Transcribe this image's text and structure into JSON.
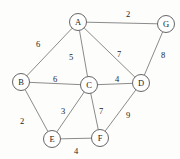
{
  "figure": {
    "type": "undirected-weighted-graph",
    "background_color": "#fdfdfc",
    "node_fill_color": "#ffffff",
    "node_stroke_color": "#555555",
    "edge_color": "#6d6d6d",
    "label_color": "#1c1c1c"
  },
  "chart_data": {
    "type": "diagram",
    "title": "",
    "xlabel": "",
    "ylabel": "",
    "graph_kind": "undirected weighted graph",
    "nodes": [
      {
        "id": "A",
        "label": "A",
        "x": 78,
        "y": 22,
        "r": 8.5
      },
      {
        "id": "G",
        "label": "G",
        "x": 166,
        "y": 24,
        "r": 8.5
      },
      {
        "id": "B",
        "label": "B",
        "x": 21,
        "y": 82,
        "r": 8.5
      },
      {
        "id": "C",
        "label": "C",
        "x": 89,
        "y": 85,
        "r": 8.5
      },
      {
        "id": "D",
        "label": "D",
        "x": 141,
        "y": 83,
        "r": 8.5
      },
      {
        "id": "E",
        "label": "E",
        "x": 52,
        "y": 139,
        "r": 8.5
      },
      {
        "id": "F",
        "label": "F",
        "x": 100,
        "y": 138,
        "r": 8.5
      }
    ],
    "edges": [
      {
        "source": "A",
        "target": "G",
        "weight": 2,
        "label": "2",
        "lx": 128,
        "ly": 14
      },
      {
        "source": "A",
        "target": "B",
        "weight": 6,
        "label": "6",
        "lx": 38,
        "ly": 44
      },
      {
        "source": "A",
        "target": "C",
        "weight": 5,
        "label": "5",
        "lx": 71,
        "ly": 57
      },
      {
        "source": "A",
        "target": "D",
        "weight": 7,
        "label": "7",
        "lx": 119,
        "ly": 54
      },
      {
        "source": "G",
        "target": "D",
        "weight": 8,
        "label": "8",
        "lx": 163,
        "ly": 55
      },
      {
        "source": "B",
        "target": "C",
        "weight": 6,
        "label": "6",
        "lx": 55,
        "ly": 79
      },
      {
        "source": "C",
        "target": "D",
        "weight": 4,
        "label": "4",
        "lx": 117,
        "ly": 79
      },
      {
        "source": "B",
        "target": "E",
        "weight": 2,
        "label": "2",
        "lx": 22,
        "ly": 121
      },
      {
        "source": "C",
        "target": "E",
        "weight": 3,
        "label": "3",
        "lx": 63,
        "ly": 111
      },
      {
        "source": "C",
        "target": "F",
        "weight": 7,
        "label": "7",
        "lx": 101,
        "ly": 111
      },
      {
        "source": "D",
        "target": "F",
        "weight": 9,
        "label": "9",
        "lx": 128,
        "ly": 115
      },
      {
        "source": "E",
        "target": "F",
        "weight": 4,
        "label": "4",
        "lx": 76,
        "ly": 151
      }
    ]
  }
}
